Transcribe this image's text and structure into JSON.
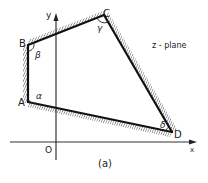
{
  "diagram": {
    "plane_label": "z - plane",
    "caption": "(a)",
    "origin_label": "O",
    "axes": {
      "x_label": "x",
      "y_label": "y"
    },
    "vertices": [
      {
        "name": "A",
        "angle_label": "α"
      },
      {
        "name": "B",
        "angle_label": "β"
      },
      {
        "name": "C",
        "angle_label": "γ"
      },
      {
        "name": "D",
        "angle_label": "δ"
      }
    ]
  }
}
